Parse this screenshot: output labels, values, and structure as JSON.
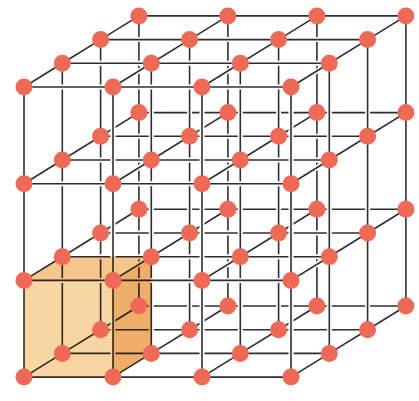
{
  "diagram": {
    "title": "Simple cubic crystal lattice",
    "lattice": {
      "nx": 4,
      "ny": 4,
      "nz": 4,
      "origin": [
        24,
        87
      ],
      "x_step": [
        89,
        0
      ],
      "y_step": [
        0,
        96.7
      ],
      "z_step": [
        38.3,
        -23.7
      ]
    },
    "atom": {
      "radius": 8.5,
      "color": "#ee6a57"
    },
    "edge_color": "#2f2f2f",
    "unit_cell": {
      "label": "unit cell",
      "i": 0,
      "j": 2,
      "k": 0,
      "front_color": "#f8d6a2",
      "top_color": "#f5c78c",
      "side_color": "#eeae6a"
    }
  }
}
